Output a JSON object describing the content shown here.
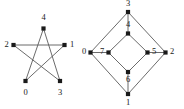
{
  "figure": {
    "title": "",
    "background_color": "#ffffff",
    "edge_color": "#5a5a5a",
    "node_color": "#1a1a1a",
    "label_color": "#1a1a1a"
  },
  "graphs": [
    {
      "name": "pentagram-graph",
      "shape": "five-pointed-star",
      "node_count": 5,
      "nodes": [
        {
          "id": "0",
          "label": "0",
          "x": 25.5,
          "y": 81.0,
          "label_x": 25.5,
          "label_y": 93.0
        },
        {
          "id": "1",
          "label": "1",
          "x": 64.5,
          "y": 45.0,
          "label_x": 72.0,
          "label_y": 45.0
        },
        {
          "id": "2",
          "label": "2",
          "x": 13.5,
          "y": 45.0,
          "label_x": 6.5,
          "label_y": 45.0
        },
        {
          "id": "3",
          "label": "3",
          "x": 60.0,
          "y": 81.0,
          "label_x": 60.0,
          "label_y": 93.0
        },
        {
          "id": "4",
          "label": "4",
          "x": 43.5,
          "y": 28.5,
          "label_x": 43.5,
          "label_y": 18.5
        }
      ],
      "edges": [
        {
          "from": "2",
          "to": "1"
        },
        {
          "from": "2",
          "to": "3"
        },
        {
          "from": "1",
          "to": "0"
        },
        {
          "from": "0",
          "to": "4"
        },
        {
          "from": "4",
          "to": "3"
        }
      ]
    },
    {
      "name": "nested-diamond-graph",
      "shape": "nested-diamond",
      "node_count": 8,
      "nodes": [
        {
          "id": "3",
          "label": "3",
          "x": 128.0,
          "y": 12.0,
          "label_x": 128.0,
          "label_y": 4.0
        },
        {
          "id": "4",
          "label": "4",
          "x": 128.0,
          "y": 33.5,
          "label_x": 128.0,
          "label_y": 25.5
        },
        {
          "id": "0",
          "label": "0",
          "x": 90.5,
          "y": 52.5,
          "label_x": 84.0,
          "label_y": 52.5
        },
        {
          "id": "7",
          "label": "7",
          "x": 108.5,
          "y": 52.5,
          "label_x": 102.0,
          "label_y": 52.5
        },
        {
          "id": "5",
          "label": "5",
          "x": 147.5,
          "y": 52.5,
          "label_x": 154.0,
          "label_y": 52.5
        },
        {
          "id": "2",
          "label": "2",
          "x": 165.5,
          "y": 52.5,
          "label_x": 172.0,
          "label_y": 52.5
        },
        {
          "id": "6",
          "label": "6",
          "x": 128.0,
          "y": 72.0,
          "label_x": 128.0,
          "label_y": 80.5
        },
        {
          "id": "1",
          "label": "1",
          "x": 128.0,
          "y": 94.0,
          "label_x": 128.0,
          "label_y": 103.0
        }
      ],
      "edges": [
        {
          "from": "3",
          "to": "0"
        },
        {
          "from": "3",
          "to": "2"
        },
        {
          "from": "0",
          "to": "1"
        },
        {
          "from": "2",
          "to": "1"
        },
        {
          "from": "4",
          "to": "7"
        },
        {
          "from": "4",
          "to": "5"
        },
        {
          "from": "7",
          "to": "6"
        },
        {
          "from": "5",
          "to": "6"
        },
        {
          "from": "3",
          "to": "4"
        },
        {
          "from": "0",
          "to": "7"
        },
        {
          "from": "2",
          "to": "5"
        },
        {
          "from": "1",
          "to": "6"
        }
      ]
    }
  ]
}
